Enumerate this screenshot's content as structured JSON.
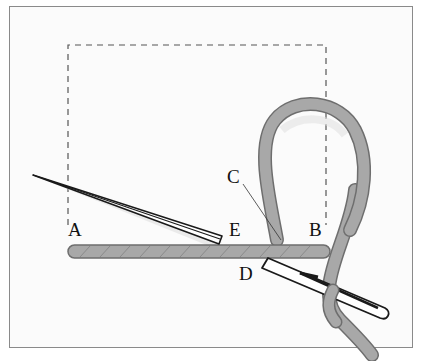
{
  "diagram": {
    "type": "embroidery-stitch-illustration",
    "labels": [
      {
        "id": "A",
        "text": "A",
        "x": 68,
        "y": 222
      },
      {
        "id": "E",
        "text": "E",
        "x": 228,
        "y": 222
      },
      {
        "id": "C",
        "text": "C",
        "x": 228,
        "y": 168
      },
      {
        "id": "B",
        "text": "B",
        "x": 310,
        "y": 222
      },
      {
        "id": "D",
        "text": "D",
        "x": 239,
        "y": 266
      }
    ],
    "colors": {
      "thread": "#a8a8a8",
      "thread_outline": "#6e6e6e",
      "needle_outline": "#1a1a1a",
      "dashed_outline": "#555555",
      "frame_border": "#8a8a8a"
    }
  }
}
